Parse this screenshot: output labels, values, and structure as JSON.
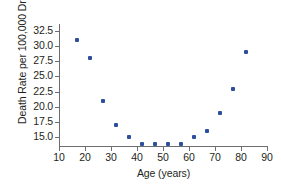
{
  "chart_data": {
    "type": "scatter",
    "title": "",
    "xlabel": "Age (years)",
    "ylabel": "Death Rate per 100,000 Drivers",
    "xlim": [
      10,
      90
    ],
    "ylim": [
      13.6,
      33.6
    ],
    "grid": false,
    "legend": "none",
    "marker_color": "#2e4e9e",
    "axis_color": "#6d6e70",
    "xticks": [
      10,
      20,
      30,
      40,
      50,
      60,
      70,
      80,
      90
    ],
    "xtick_labels": [
      "10",
      "20",
      "30",
      "40",
      "50",
      "60",
      "70",
      "80",
      "90"
    ],
    "yticks": [
      15.0,
      17.5,
      20.0,
      22.5,
      25.0,
      27.5,
      30.0,
      32.5
    ],
    "ytick_labels": [
      "15.0",
      "17.5",
      "20.0",
      "22.5",
      "25.0",
      "27.5",
      "30.0",
      "32.5"
    ],
    "x": [
      17,
      22,
      27,
      32,
      37,
      42,
      47,
      52,
      57,
      62,
      67,
      72,
      77,
      82
    ],
    "y": [
      31,
      28,
      21,
      17,
      15,
      14,
      14,
      14,
      14,
      15,
      16,
      19,
      23,
      29
    ],
    "points": [
      {
        "x": 17,
        "y": 31
      },
      {
        "x": 22,
        "y": 28
      },
      {
        "x": 27,
        "y": 21
      },
      {
        "x": 32,
        "y": 17
      },
      {
        "x": 37,
        "y": 15
      },
      {
        "x": 42,
        "y": 14
      },
      {
        "x": 47,
        "y": 14
      },
      {
        "x": 52,
        "y": 14
      },
      {
        "x": 57,
        "y": 14
      },
      {
        "x": 62,
        "y": 15
      },
      {
        "x": 67,
        "y": 16
      },
      {
        "x": 72,
        "y": 19
      },
      {
        "x": 77,
        "y": 23
      },
      {
        "x": 82,
        "y": 29
      }
    ]
  }
}
